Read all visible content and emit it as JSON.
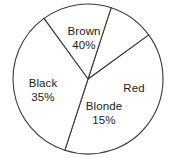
{
  "chart_data": {
    "type": "pie",
    "title": "",
    "subtitle": "",
    "xlabel": "",
    "ylabel": "",
    "legend": "none",
    "grid": false,
    "value_suffix": "%",
    "categories": [
      "Brown",
      "Black",
      "Blonde",
      "Red"
    ],
    "values": [
      40,
      35,
      15,
      10
    ],
    "slices": [
      {
        "label": "Brown",
        "value": 40,
        "value_text": "40%",
        "value_shown": true,
        "fill": "#ffffff",
        "stroke": "#3a3a3a"
      },
      {
        "label": "Black",
        "value": 35,
        "value_text": "35%",
        "value_shown": true,
        "fill": "#ffffff",
        "stroke": "#3a3a3a"
      },
      {
        "label": "Blonde",
        "value": 15,
        "value_text": "15%",
        "value_shown": true,
        "fill": "#ffffff",
        "stroke": "#3a3a3a"
      },
      {
        "label": "Red",
        "value": 10,
        "value_text": "",
        "value_shown": false,
        "fill": "#ffffff",
        "stroke": "#3a3a3a"
      }
    ],
    "geometry": {
      "center_x": 88,
      "center_y": 79,
      "radius": 75,
      "start_angle_deg": -36,
      "direction": "clockwise"
    },
    "style": {
      "background": "#ffffff",
      "outline_color": "#3a3a3a",
      "text_color": "#1d1d1d"
    }
  },
  "labels": {
    "brown": {
      "name": "Brown",
      "value": "40%"
    },
    "black": {
      "name": "Black",
      "value": "35%"
    },
    "blonde": {
      "name": "Blonde",
      "value": "15%"
    },
    "red": {
      "name": "Red",
      "value": ""
    }
  }
}
